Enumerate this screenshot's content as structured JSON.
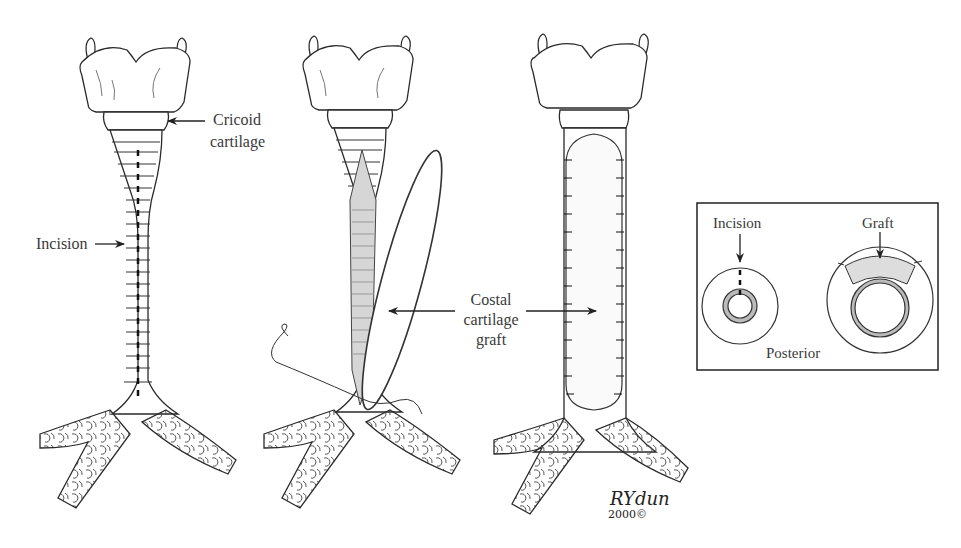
{
  "figure": {
    "panels": [
      {
        "id": "panel-1",
        "stage": "incision",
        "labels": {
          "cricoid_line1": "Cricoid",
          "cricoid_line2": "cartilage",
          "incision": "Incision"
        }
      },
      {
        "id": "panel-2",
        "stage": "graft-placement"
      },
      {
        "id": "panel-3",
        "stage": "graft-sutured"
      }
    ],
    "shared_label": {
      "line1": "Costal",
      "line2": "cartilage",
      "line3": "graft"
    },
    "inset": {
      "incision_label": "Incision",
      "graft_label": "Graft",
      "posterior_label": "Posterior"
    },
    "signature": {
      "name": "RYdun",
      "year": "2000©"
    }
  },
  "colors": {
    "line": "#2a2a2a",
    "text": "#3a3a3a",
    "graft_fill": "#d9d9d9",
    "background": "#ffffff"
  }
}
